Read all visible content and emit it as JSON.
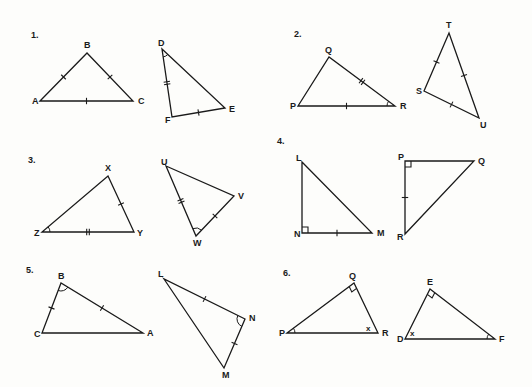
{
  "problems": [
    {
      "number": "1.",
      "label_pos": [
        31,
        38
      ],
      "triangles": [
        {
          "name": "ABC",
          "vertices": {
            "A": [
              40,
              101
            ],
            "B": [
              87,
              53
            ],
            "C": [
              133,
              101
            ]
          },
          "label_offsets": {
            "A": [
              -8,
              3
            ],
            "B": [
              -3,
              -5
            ],
            "C": [
              5,
              3
            ]
          },
          "side_marks": [
            {
              "side": [
                "A",
                "B"
              ],
              "ticks": 1
            },
            {
              "side": [
                "B",
                "C"
              ],
              "ticks": 1,
              "bold": true
            },
            {
              "side": [
                "A",
                "C"
              ],
              "ticks": 1,
              "bold": true
            }
          ],
          "angle_marks": [],
          "right_angles": []
        },
        {
          "name": "DEF",
          "vertices": {
            "D": [
              162,
              49
            ],
            "E": [
              225,
              108
            ],
            "F": [
              172,
              117
            ]
          },
          "label_offsets": {
            "D": [
              -4,
              -3
            ],
            "E": [
              4,
              4
            ],
            "F": [
              -7,
              6
            ]
          },
          "side_marks": [
            {
              "side": [
                "D",
                "F"
              ],
              "ticks": 2
            },
            {
              "side": [
                "F",
                "E"
              ],
              "ticks": 1
            }
          ],
          "angle_marks": [
            {
              "vertex": "D",
              "arcs": 1
            }
          ],
          "right_angles": []
        }
      ]
    },
    {
      "number": "2.",
      "label_pos": [
        294,
        37
      ],
      "triangles": [
        {
          "name": "PQR",
          "vertices": {
            "P": [
              298,
              106
            ],
            "Q": [
              329,
              57
            ],
            "R": [
              395,
              106
            ]
          },
          "label_offsets": {
            "P": [
              -8,
              3
            ],
            "Q": [
              -4,
              -4
            ],
            "R": [
              5,
              3
            ]
          },
          "side_marks": [
            {
              "side": [
                "Q",
                "R"
              ],
              "ticks": 2
            },
            {
              "side": [
                "P",
                "R"
              ],
              "ticks": 1
            }
          ],
          "angle_marks": [
            {
              "vertex": "R",
              "arcs": 1
            }
          ],
          "right_angles": []
        },
        {
          "name": "STU",
          "vertices": {
            "S": [
              424,
              91
            ],
            "T": [
              449,
              33
            ],
            "U": [
              479,
              118
            ]
          },
          "label_offsets": {
            "S": [
              -8,
              3
            ],
            "T": [
              -3,
              -5
            ],
            "U": [
              1,
              10
            ]
          },
          "side_marks": [
            {
              "side": [
                "S",
                "T"
              ],
              "ticks": 1,
              "bold": true
            },
            {
              "side": [
                "T",
                "U"
              ],
              "ticks": 1,
              "bold": true
            },
            {
              "side": [
                "S",
                "U"
              ],
              "ticks": 1
            }
          ],
          "angle_marks": [],
          "right_angles": []
        }
      ]
    },
    {
      "number": "3.",
      "label_pos": [
        28,
        163
      ],
      "triangles": [
        {
          "name": "XYZ",
          "vertices": {
            "X": [
              108,
              176
            ],
            "Y": [
              134,
              232
            ],
            "Z": [
              42,
              232
            ]
          },
          "label_offsets": {
            "X": [
              -3,
              -5
            ],
            "Y": [
              3,
              4
            ],
            "Z": [
              -8,
              4
            ]
          },
          "side_marks": [
            {
              "side": [
                "X",
                "Y"
              ],
              "ticks": 1
            },
            {
              "side": [
                "Z",
                "Y"
              ],
              "ticks": 2
            }
          ],
          "angle_marks": [
            {
              "vertex": "Z",
              "arcs": 1
            }
          ],
          "right_angles": []
        },
        {
          "name": "UVW",
          "vertices": {
            "U": [
              166,
              166
            ],
            "V": [
              234,
              196
            ],
            "W": [
              196,
              236
            ]
          },
          "label_offsets": {
            "U": [
              -5,
              -1
            ],
            "V": [
              4,
              3
            ],
            "W": [
              -3,
              10
            ]
          },
          "side_marks": [
            {
              "side": [
                "U",
                "W"
              ],
              "ticks": 2
            },
            {
              "side": [
                "W",
                "V"
              ],
              "ticks": 1
            }
          ],
          "angle_marks": [
            {
              "vertex": "W",
              "arcs": 1
            }
          ],
          "right_angles": []
        }
      ]
    },
    {
      "number": "4.",
      "label_pos": [
        277,
        144
      ],
      "triangles": [
        {
          "name": "LMN",
          "vertices": {
            "L": [
              302,
              162
            ],
            "M": [
              372,
              233
            ],
            "N": [
              302,
              233
            ]
          },
          "label_offsets": {
            "L": [
              -6,
              -1
            ],
            "M": [
              5,
              3
            ],
            "N": [
              -8,
              4
            ]
          },
          "side_marks": [
            {
              "side": [
                "N",
                "M"
              ],
              "ticks": 1
            }
          ],
          "angle_marks": [],
          "right_angles": [
            "N"
          ]
        },
        {
          "name": "PQR",
          "vertices": {
            "P": [
              405,
              161
            ],
            "Q": [
              474,
              161
            ],
            "R": [
              405,
              234
            ]
          },
          "label_offsets": {
            "P": [
              -7,
              -1
            ],
            "Q": [
              4,
              3
            ],
            "R": [
              -8,
              6
            ]
          },
          "side_marks": [
            {
              "side": [
                "P",
                "R"
              ],
              "ticks": 1
            }
          ],
          "angle_marks": [],
          "right_angles": [
            "P"
          ]
        }
      ]
    },
    {
      "number": "5.",
      "label_pos": [
        26,
        273
      ],
      "triangles": [
        {
          "name": "ABC",
          "vertices": {
            "A": [
              143,
              333
            ],
            "B": [
              61,
              283
            ],
            "C": [
              42,
              333
            ]
          },
          "label_offsets": {
            "A": [
              4,
              3
            ],
            "B": [
              -3,
              -4
            ],
            "C": [
              -8,
              4
            ]
          },
          "side_marks": [
            {
              "side": [
                "C",
                "B"
              ],
              "ticks": 1
            },
            {
              "side": [
                "B",
                "A"
              ],
              "ticks": 1,
              "bold": true
            }
          ],
          "angle_marks": [
            {
              "vertex": "B",
              "arcs": 1
            }
          ],
          "right_angles": []
        },
        {
          "name": "LMN",
          "vertices": {
            "L": [
              164,
              279
            ],
            "M": [
              224,
              368
            ],
            "N": [
              245,
              319
            ]
          },
          "label_offsets": {
            "L": [
              -6,
              -2
            ],
            "M": [
              -2,
              10
            ],
            "N": [
              4,
              2
            ]
          },
          "side_marks": [
            {
              "side": [
                "L",
                "N"
              ],
              "ticks": 1,
              "bold": true
            },
            {
              "side": [
                "N",
                "M"
              ],
              "ticks": 1
            }
          ],
          "angle_marks": [
            {
              "vertex": "N",
              "arcs": 1
            }
          ],
          "right_angles": []
        }
      ]
    },
    {
      "number": "6.",
      "label_pos": [
        283,
        276
      ],
      "triangles": [
        {
          "name": "PQR",
          "vertices": {
            "P": [
              287,
              333
            ],
            "Q": [
              354,
              283
            ],
            "R": [
              378,
              333
            ]
          },
          "label_offsets": {
            "P": [
              -8,
              3
            ],
            "Q": [
              -5,
              -4
            ],
            "R": [
              4,
              3
            ]
          },
          "side_marks": [],
          "angle_marks": [
            {
              "vertex": "P",
              "arcs": 1
            }
          ],
          "right_angles": [
            "Q"
          ],
          "angle_labels": [
            {
              "vertex": "R",
              "text": "x",
              "offset": [
                -12,
                -2
              ]
            }
          ]
        },
        {
          "name": "DEF",
          "vertices": {
            "D": [
              405,
              339
            ],
            "E": [
              430,
              289
            ],
            "F": [
              495,
              339
            ]
          },
          "label_offsets": {
            "D": [
              -8,
              3
            ],
            "E": [
              -3,
              -4
            ],
            "F": [
              4,
              3
            ]
          },
          "side_marks": [],
          "angle_marks": [
            {
              "vertex": "F",
              "arcs": 1
            }
          ],
          "right_angles": [
            "E"
          ],
          "angle_labels": [
            {
              "vertex": "D",
              "text": "x",
              "offset": [
                5,
                -3
              ]
            }
          ]
        }
      ]
    }
  ]
}
